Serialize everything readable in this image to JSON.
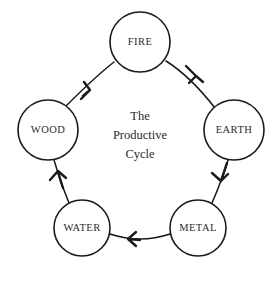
{
  "diagram": {
    "title_lines": [
      "The",
      "Productive",
      "Cycle"
    ],
    "title_full": "The Productive Cycle",
    "stroke_color": "#1a1a1a",
    "text_color": "#2b2b2b",
    "background_color": "#ffffff",
    "nodes": [
      {
        "id": "fire",
        "label": "FIRE",
        "cx": 140,
        "cy": 42,
        "r": 30
      },
      {
        "id": "earth",
        "label": "EARTH",
        "cx": 234,
        "cy": 130,
        "r": 30
      },
      {
        "id": "metal",
        "label": "METAL",
        "cx": 198,
        "cy": 228,
        "r": 28
      },
      {
        "id": "water",
        "label": "WATER",
        "cx": 82,
        "cy": 228,
        "r": 28
      },
      {
        "id": "wood",
        "label": "WOOD",
        "cx": 48,
        "cy": 130,
        "r": 30
      }
    ],
    "edges": [
      {
        "id": "wood-to-fire",
        "from": "WOOD",
        "to": "FIRE",
        "direction": "up-right"
      },
      {
        "id": "fire-to-earth",
        "from": "FIRE",
        "to": "EARTH",
        "direction": "down-right"
      },
      {
        "id": "earth-to-metal",
        "from": "EARTH",
        "to": "METAL",
        "direction": "down"
      },
      {
        "id": "metal-to-water",
        "from": "METAL",
        "to": "WATER",
        "direction": "left"
      },
      {
        "id": "water-to-wood",
        "from": "WATER",
        "to": "WOOD",
        "direction": "up"
      }
    ]
  }
}
